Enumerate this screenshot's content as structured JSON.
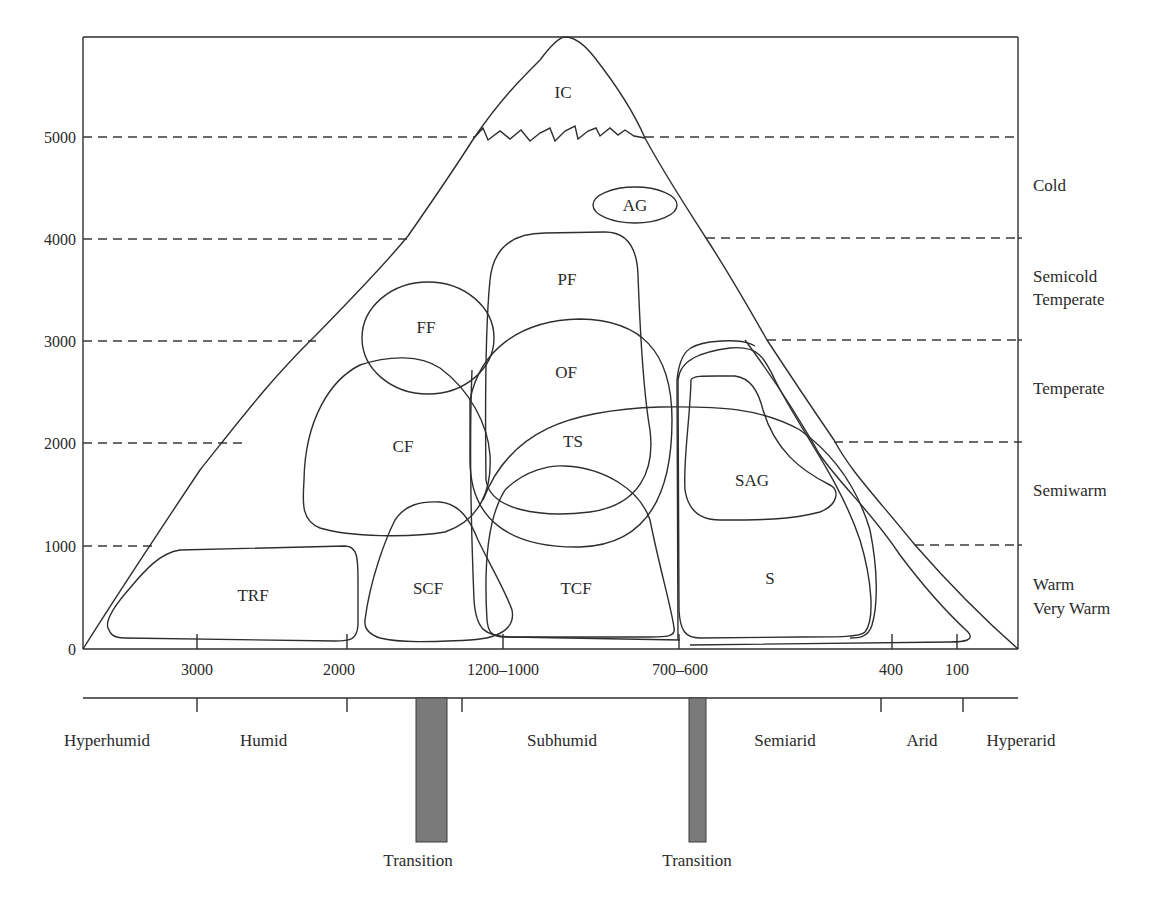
{
  "diagram": {
    "type": "altitude-precipitation vegetation diagram",
    "y_axis": {
      "ticks": [
        "5000",
        "4000",
        "3000",
        "2000",
        "1000",
        "0"
      ]
    },
    "x_axis": {
      "ticks": [
        "3000",
        "2000",
        "1200–1000",
        "700–600",
        "400",
        "100"
      ]
    },
    "climate_zones": {
      "cold": "Cold",
      "semicold": "Semicold",
      "temperate_a": "Temperate",
      "temperate": "Temperate",
      "semiwarm": "Semiwarm",
      "warm": "Warm",
      "very_warm": "Very Warm"
    },
    "humidity_zones": {
      "hyperhumid": "Hyperhumid",
      "humid": "Humid",
      "subhumid": "Subhumid",
      "semiarid": "Semiarid",
      "arid": "Arid",
      "hyperarid": "Hyperarid"
    },
    "transitions": [
      "Transition",
      "Transition"
    ],
    "regions": {
      "ic": "IC",
      "ag": "AG",
      "pf": "PF",
      "ff": "FF",
      "of": "OF",
      "cf": "CF",
      "ts": "TS",
      "sag": "SAG",
      "trf": "TRF",
      "scf": "SCF",
      "tcf": "TCF",
      "s": "S"
    },
    "colors": {
      "line": "#2e2e2e",
      "transition_bar": "#7a7a7a"
    }
  }
}
